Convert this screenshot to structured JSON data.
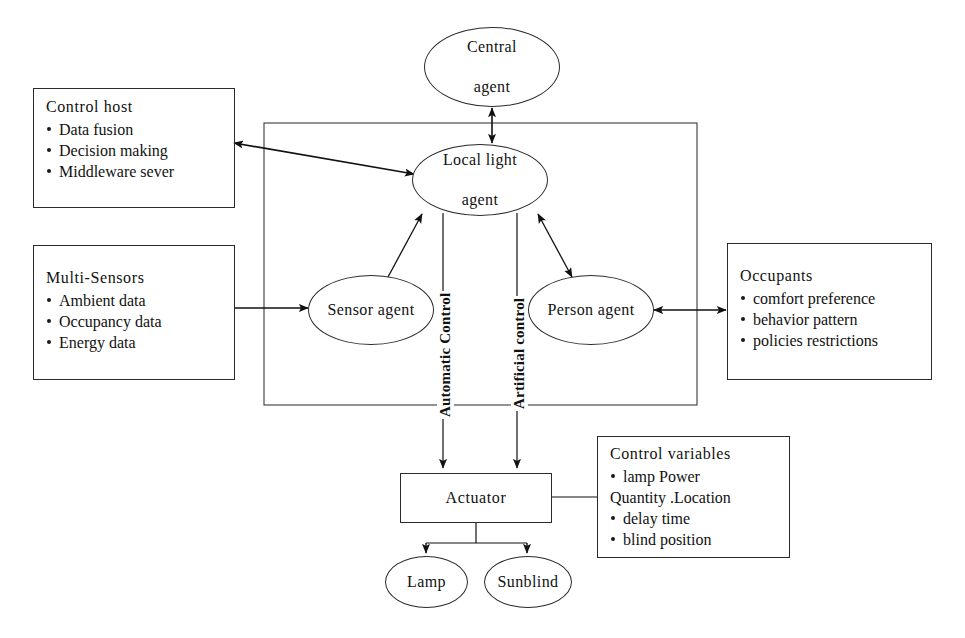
{
  "diagram": {
    "type": "block-diagram",
    "stroke_color": "#2b2b2b",
    "background_color": "#ffffff"
  },
  "boxes": {
    "control_host": {
      "title": "Control host",
      "items": [
        "Data fusion",
        "Decision making",
        "Middleware sever"
      ]
    },
    "multi_sensors": {
      "title": "Multi-Sensors",
      "items": [
        "Ambient data",
        "Occupancy data",
        "Energy data"
      ]
    },
    "occupants": {
      "title": "Occupants",
      "items": [
        "comfort preference",
        "behavior pattern",
        "policies restrictions"
      ]
    },
    "control_variables": {
      "title": "Control variables",
      "items": [
        "lamp Power",
        "Quantity .Location",
        "delay time",
        "blind position"
      ],
      "item_bullets": [
        true,
        false,
        true,
        true
      ]
    }
  },
  "nodes": {
    "central_agent": {
      "label_line1": "Central",
      "label_line2": "agent"
    },
    "local_light_agent": {
      "label_line1": "Local light",
      "label_line2": "agent"
    },
    "sensor_agent": {
      "label": "Sensor agent"
    },
    "person_agent": {
      "label": "Person agent"
    },
    "actuator": {
      "label": "Actuator"
    },
    "lamp": {
      "label": "Lamp"
    },
    "sunblind": {
      "label": "Sunblind"
    }
  },
  "edge_labels": {
    "automatic_control": "Automatic Control",
    "artificial_control": "Artificial control"
  }
}
